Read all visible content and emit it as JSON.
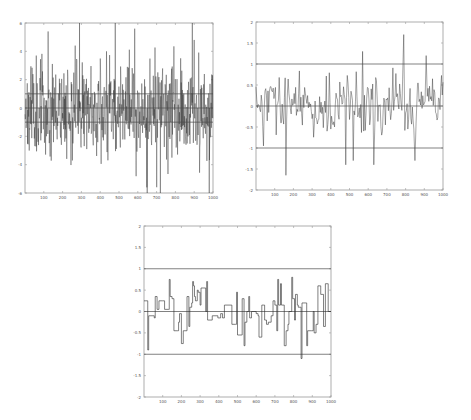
{
  "chart_data": [
    {
      "id": "chart1",
      "type": "line",
      "title": "",
      "xlabel": "",
      "ylabel": "",
      "xlim": [
        0,
        1000
      ],
      "ylim": [
        -6,
        6
      ],
      "x_ticks": [
        100,
        200,
        300,
        400,
        500,
        600,
        700,
        800,
        900,
        1000
      ],
      "y_ticks": [
        -6,
        -4,
        -2,
        0,
        2,
        4,
        6
      ],
      "y_tick_labels": [
        "-6",
        "-4",
        "-2",
        "0",
        "2",
        "4",
        "6"
      ],
      "reference_lines": [
        1,
        0,
        -1
      ],
      "grid": false,
      "legend": null,
      "series": [
        {
          "name": "noisy signal",
          "n_points": 1000,
          "description": "dense high-variance noise, mostly within ±4, occasional spikes reaching +6 (near x≈290, 480, 890) and down to about -6 (near x≈650, 720, 980)"
        }
      ],
      "frame": {
        "x": 25,
        "y": 23,
        "w": 188,
        "h": 170
      },
      "seed": 11,
      "amp": 1.6,
      "spikes_up": [
        290,
        480,
        890
      ],
      "spikes_down": [
        650,
        720,
        980
      ]
    },
    {
      "id": "chart2",
      "type": "line",
      "title": "",
      "xlabel": "",
      "ylabel": "",
      "xlim": [
        0,
        1000
      ],
      "ylim": [
        -2,
        2
      ],
      "x_ticks": [
        100,
        200,
        300,
        400,
        500,
        600,
        700,
        800,
        900,
        1000
      ],
      "y_ticks": [
        -2,
        -1.5,
        -1,
        -0.5,
        0,
        0.5,
        1,
        1.5,
        2
      ],
      "y_tick_labels": [
        "-2",
        "-1.5",
        "-1",
        "-0.5",
        "0",
        "0.5",
        "1",
        "1.5",
        "2"
      ],
      "reference_lines": [
        1,
        0,
        -1
      ],
      "grid": false,
      "legend": null,
      "series": [
        {
          "name": "filtered signal",
          "n_points": 1000,
          "description": "smoothed oscillating signal mostly within ±1; minimum ≈ -1.65 near x≈160, maximum ≈ 1.7 near x≈790; excursions near -1.3 around x≈480, 520, 630, 850"
        }
      ],
      "frame": {
        "x": 256,
        "y": 22,
        "w": 187,
        "h": 168
      },
      "seed": 29,
      "amp": 0.5,
      "extremes": [
        [
          160,
          -1.65
        ],
        [
          790,
          1.7
        ],
        [
          570,
          1.3
        ],
        [
          480,
          -1.4
        ],
        [
          520,
          -1.3
        ],
        [
          630,
          -1.4
        ],
        [
          850,
          -1.3
        ],
        [
          910,
          1.2
        ],
        [
          40,
          -0.95
        ]
      ]
    },
    {
      "id": "chart3",
      "type": "line",
      "title": "",
      "xlabel": "",
      "ylabel": "",
      "xlim": [
        0,
        1000
      ],
      "ylim": [
        -2,
        2
      ],
      "x_ticks": [
        100,
        200,
        300,
        400,
        500,
        600,
        700,
        800,
        900,
        1000
      ],
      "y_ticks": [
        -2,
        -1.5,
        -1,
        -0.5,
        0,
        0.5,
        1,
        1.5,
        2
      ],
      "y_tick_labels": [
        "-2",
        "-1.5",
        "-1",
        "-0.5",
        "0",
        "0.5",
        "1",
        "1.5",
        "2"
      ],
      "reference_lines": [
        1,
        0,
        -1
      ],
      "grid": false,
      "legend": null,
      "series": [
        {
          "name": "piecewise-constant estimate",
          "description": "step function within about ±1",
          "steps": [
            [
              0,
              0.25
            ],
            [
              10,
              0.25
            ],
            [
              20,
              -0.9
            ],
            [
              25,
              -0.1
            ],
            [
              55,
              -0.15
            ],
            [
              60,
              0.35
            ],
            [
              70,
              0.05
            ],
            [
              80,
              0.25
            ],
            [
              100,
              0.25
            ],
            [
              110,
              0.05
            ],
            [
              130,
              0.05
            ],
            [
              135,
              0.75
            ],
            [
              140,
              0.35
            ],
            [
              150,
              0.3
            ],
            [
              160,
              -0.45
            ],
            [
              180,
              -0.45
            ],
            [
              185,
              -0.25
            ],
            [
              190,
              -0.05
            ],
            [
              200,
              -0.75
            ],
            [
              210,
              -0.45
            ],
            [
              225,
              -0.45
            ],
            [
              230,
              0.35
            ],
            [
              240,
              -0.35
            ],
            [
              245,
              0.1
            ],
            [
              255,
              0.2
            ],
            [
              260,
              0.7
            ],
            [
              265,
              0.6
            ],
            [
              270,
              0.35
            ],
            [
              275,
              0.25
            ],
            [
              285,
              0.5
            ],
            [
              290,
              0.45
            ],
            [
              300,
              0.15
            ],
            [
              305,
              0.55
            ],
            [
              320,
              0.55
            ],
            [
              330,
              0.0
            ],
            [
              335,
              0.7
            ],
            [
              340,
              -0.2
            ],
            [
              365,
              -0.1
            ],
            [
              385,
              -0.1
            ],
            [
              395,
              -0.15
            ],
            [
              400,
              -0.15
            ],
            [
              410,
              -0.05
            ],
            [
              420,
              -0.15
            ],
            [
              430,
              0.15
            ],
            [
              460,
              0.15
            ],
            [
              470,
              -0.3
            ],
            [
              490,
              -0.3
            ],
            [
              495,
              0.45
            ],
            [
              500,
              -0.55
            ],
            [
              520,
              -0.55
            ],
            [
              525,
              0.3
            ],
            [
              535,
              -0.8
            ],
            [
              540,
              -0.25
            ],
            [
              550,
              0.0
            ],
            [
              560,
              0.35
            ],
            [
              565,
              -0.15
            ],
            [
              575,
              0.0
            ],
            [
              600,
              -0.05
            ],
            [
              610,
              -0.1
            ],
            [
              615,
              -0.6
            ],
            [
              630,
              0.15
            ],
            [
              640,
              0.15
            ],
            [
              645,
              -0.2
            ],
            [
              655,
              -0.3
            ],
            [
              665,
              -0.25
            ],
            [
              680,
              -0.1
            ],
            [
              690,
              0.25
            ],
            [
              700,
              0.15
            ],
            [
              710,
              -0.45
            ],
            [
              715,
              0.75
            ],
            [
              720,
              0.15
            ],
            [
              730,
              0.65
            ],
            [
              735,
              0.15
            ],
            [
              750,
              -0.8
            ],
            [
              760,
              -0.45
            ],
            [
              770,
              -0.3
            ],
            [
              775,
              0.0
            ],
            [
              790,
              0.8
            ],
            [
              795,
              0.3
            ],
            [
              805,
              -0.2
            ],
            [
              810,
              0.4
            ],
            [
              820,
              0.15
            ],
            [
              825,
              0.1
            ],
            [
              840,
              -1.1
            ],
            [
              845,
              0.2
            ],
            [
              855,
              0.2
            ],
            [
              865,
              0.2
            ],
            [
              870,
              -0.8
            ],
            [
              875,
              -0.45
            ],
            [
              895,
              -0.45
            ],
            [
              905,
              0.0
            ],
            [
              910,
              -0.5
            ],
            [
              920,
              -0.3
            ],
            [
              930,
              0.6
            ],
            [
              945,
              0.4
            ],
            [
              960,
              -0.35
            ],
            [
              970,
              0.65
            ],
            [
              980,
              0.65
            ],
            [
              985,
              0.0
            ],
            [
              1000,
              0.0
            ]
          ]
        }
      ],
      "frame": {
        "x": 144,
        "y": 226,
        "w": 187,
        "h": 171
      }
    }
  ],
  "colors": {
    "axis": "#9a9a9a",
    "series": "#2a2a2a",
    "reference_line": "#4a4a4a",
    "tick_label": "#6a6a6a",
    "background": "#ffffff"
  }
}
